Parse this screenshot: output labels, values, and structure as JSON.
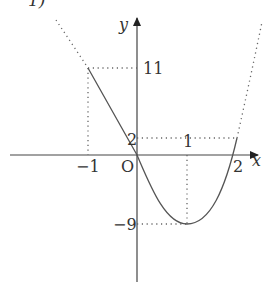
{
  "header_fragment": "1)",
  "axes": {
    "x_label": "x",
    "y_label": "y",
    "origin_label": "O"
  },
  "tick_labels": {
    "x_neg1": "−1",
    "x_1": "1",
    "x_2": "2",
    "y_11": "11",
    "y_2": "2",
    "y_neg9": "−9"
  },
  "key_points": [
    {
      "x": -1,
      "y": 11
    },
    {
      "x": 0,
      "y": 0
    },
    {
      "x": 1,
      "y": -9
    },
    {
      "x": 2,
      "y": 2
    }
  ],
  "colors": {
    "curve": "#555555",
    "axis": "#444444",
    "dotted": "#666666"
  }
}
